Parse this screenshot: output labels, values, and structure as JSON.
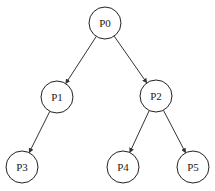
{
  "diagram": {
    "type": "tree",
    "nodes": [
      {
        "id": "P0",
        "label": "P0",
        "x": 105,
        "y": 23
      },
      {
        "id": "P1",
        "label": "P1",
        "x": 57,
        "y": 97
      },
      {
        "id": "P2",
        "label": "P2",
        "x": 156,
        "y": 96
      },
      {
        "id": "P3",
        "label": "P3",
        "x": 22,
        "y": 167
      },
      {
        "id": "P4",
        "label": "P4",
        "x": 123,
        "y": 167
      },
      {
        "id": "P5",
        "label": "P5",
        "x": 193,
        "y": 167
      }
    ],
    "edges": [
      {
        "from": "P0",
        "to": "P1"
      },
      {
        "from": "P0",
        "to": "P2"
      },
      {
        "from": "P1",
        "to": "P3"
      },
      {
        "from": "P2",
        "to": "P4"
      },
      {
        "from": "P2",
        "to": "P5"
      }
    ],
    "node_radius": 16
  }
}
